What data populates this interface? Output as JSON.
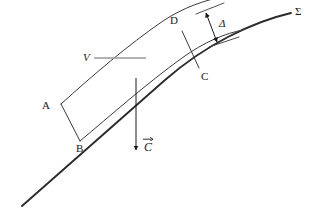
{
  "figure": {
    "kind": "geometry-diagram",
    "background_color": "#ffffff",
    "curve_color": "#2b2b2b",
    "band_color": "#3a3a3a",
    "leader_color": "#9a9a9a",
    "arrow_color": "#1a1a1a",
    "text_color": "#1a1a1a"
  },
  "labels": {
    "sigma": "Σ",
    "delta": "Δ",
    "point_a": "A",
    "point_b": "B",
    "point_c": "C",
    "point_d": "D",
    "volume": "V",
    "vector_c": "C"
  }
}
